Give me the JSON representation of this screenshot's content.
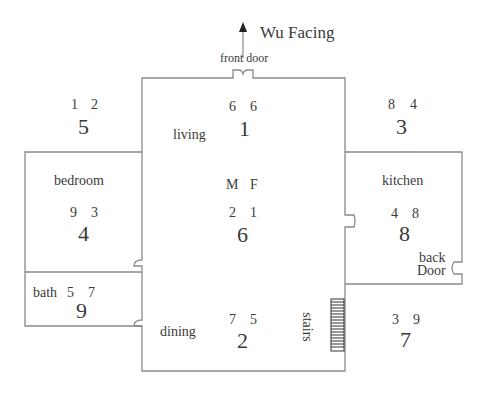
{
  "compass": {
    "label": "Wu Facing",
    "arrow": "north-up"
  },
  "doors": {
    "front": "front door",
    "back_line1": "back",
    "back_line2": "Door"
  },
  "rooms": {
    "living": "living",
    "bedroom": "bedroom",
    "bath": "bath",
    "dining": "dining",
    "kitchen": "kitchen",
    "stairs": "stairs"
  },
  "center": {
    "m_label": "M",
    "f_label": "F"
  },
  "palaces": [
    {
      "position": "north-west",
      "mountain": "1",
      "facing": "2",
      "base": "5"
    },
    {
      "position": "north",
      "mountain": "6",
      "facing": "6",
      "base": "1"
    },
    {
      "position": "north-east",
      "mountain": "8",
      "facing": "4",
      "base": "3"
    },
    {
      "position": "west",
      "mountain": "9",
      "facing": "3",
      "base": "4"
    },
    {
      "position": "center",
      "mountain": "2",
      "facing": "1",
      "base": "6"
    },
    {
      "position": "east",
      "mountain": "4",
      "facing": "8",
      "base": "8"
    },
    {
      "position": "south-west",
      "mountain": "5",
      "facing": "7",
      "base": "9"
    },
    {
      "position": "south",
      "mountain": "7",
      "facing": "5",
      "base": "2"
    },
    {
      "position": "south-east",
      "mountain": "3",
      "facing": "9",
      "base": "7"
    }
  ],
  "colors": {
    "line": "#8a8a8a",
    "text": "#3a3a3a",
    "background": "#ffffff"
  }
}
